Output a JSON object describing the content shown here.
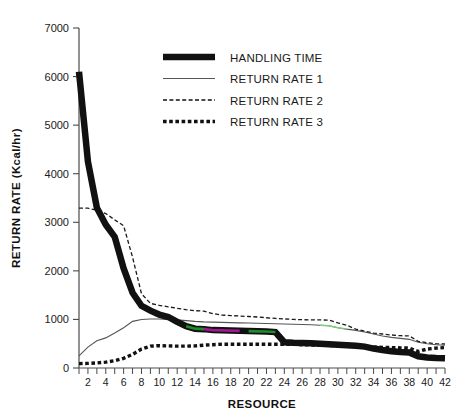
{
  "chart_data": {
    "type": "line",
    "title": "",
    "xlabel": "RESOURCE",
    "ylabel": "RETURN RATE (Kcal/hr)",
    "xlim": [
      1,
      42
    ],
    "ylim": [
      0,
      7000
    ],
    "grid": false,
    "legend_position": "top-center",
    "y_ticks": [
      0,
      1000,
      2000,
      3000,
      4000,
      5000,
      6000,
      7000
    ],
    "y_tick_labels": [
      "0",
      "1000",
      "2000",
      "3000",
      "4000",
      "5000",
      "6000",
      "7000"
    ],
    "x_ticks": [
      2,
      4,
      6,
      8,
      10,
      12,
      14,
      16,
      18,
      20,
      22,
      24,
      26,
      28,
      30,
      32,
      34,
      36,
      38,
      40,
      42
    ],
    "x_tick_labels": [
      "2",
      "4",
      "6",
      "8",
      "10",
      "12",
      "14",
      "16",
      "18",
      "20",
      "22",
      "24",
      "26",
      "28",
      "30",
      "32",
      "34",
      "36",
      "38",
      "40",
      "42"
    ],
    "x": [
      1,
      2,
      3,
      4,
      5,
      6,
      7,
      8,
      9,
      10,
      11,
      12,
      13,
      14,
      15,
      16,
      17,
      18,
      19,
      20,
      21,
      22,
      23,
      24,
      25,
      26,
      27,
      28,
      29,
      30,
      31,
      32,
      33,
      34,
      35,
      36,
      37,
      38,
      39,
      40,
      41,
      42
    ],
    "series": [
      {
        "name": "HANDLING TIME",
        "style": "thick-solid",
        "color": "#111111",
        "values": [
          6100,
          4250,
          3300,
          2950,
          2700,
          2050,
          1550,
          1280,
          1180,
          1100,
          1050,
          950,
          860,
          810,
          800,
          780,
          775,
          770,
          765,
          760,
          755,
          750,
          740,
          530,
          520,
          515,
          510,
          500,
          490,
          480,
          470,
          460,
          440,
          400,
          370,
          345,
          330,
          320,
          240,
          215,
          205,
          200
        ]
      },
      {
        "name": "RETURN RATE 1",
        "style": "thin-solid",
        "color": "#555555",
        "values": [
          250,
          430,
          560,
          620,
          720,
          830,
          960,
          1000,
          1010,
          1010,
          1000,
          990,
          975,
          960,
          950,
          945,
          940,
          935,
          930,
          925,
          920,
          915,
          910,
          905,
          900,
          895,
          890,
          880,
          870,
          830,
          800,
          775,
          740,
          700,
          660,
          630,
          610,
          590,
          530,
          500,
          480,
          470
        ]
      },
      {
        "name": "RETURN RATE 2",
        "style": "dashed",
        "color": "#1a1a1a",
        "values": [
          3290,
          3290,
          3250,
          3180,
          3050,
          2930,
          2280,
          1530,
          1330,
          1290,
          1260,
          1230,
          1200,
          1180,
          1170,
          1120,
          1090,
          1080,
          1070,
          1060,
          1050,
          1035,
          1020,
          1010,
          1000,
          995,
          990,
          990,
          985,
          930,
          880,
          800,
          760,
          720,
          700,
          680,
          665,
          660,
          550,
          520,
          500,
          495
        ]
      },
      {
        "name": "RETURN RATE 3",
        "style": "dotted-thick",
        "color": "#111111",
        "values": [
          90,
          95,
          105,
          120,
          150,
          200,
          280,
          390,
          450,
          460,
          455,
          450,
          450,
          455,
          470,
          480,
          490,
          490,
          490,
          490,
          490,
          490,
          490,
          490,
          490,
          480,
          475,
          470,
          465,
          460,
          455,
          450,
          440,
          430,
          425,
          420,
          415,
          410,
          340,
          390,
          410,
          420
        ]
      }
    ],
    "annotations": [
      {
        "note": "magenta tint segment over handling-time line",
        "x_range": [
          15,
          19
        ],
        "color": "#b0179b"
      },
      {
        "note": "green tint segment over handling-time line",
        "x_range": [
          13,
          15
        ],
        "color": "#1f9c2a"
      },
      {
        "note": "green tint segment over handling-time line",
        "x_range": [
          20,
          23
        ],
        "color": "#1f9c2a"
      },
      {
        "note": "green tint segment over return-rate-1 line",
        "x_range": [
          28,
          31
        ],
        "color": "#7fd07f"
      }
    ]
  },
  "legend": {
    "items": [
      {
        "label": "HANDLING TIME",
        "swatch": "thick-solid"
      },
      {
        "label": "RETURN RATE 1",
        "swatch": "thin-solid"
      },
      {
        "label": "RETURN RATE 2",
        "swatch": "dashed"
      },
      {
        "label": "RETURN RATE 3",
        "swatch": "dotted-thick"
      }
    ]
  }
}
